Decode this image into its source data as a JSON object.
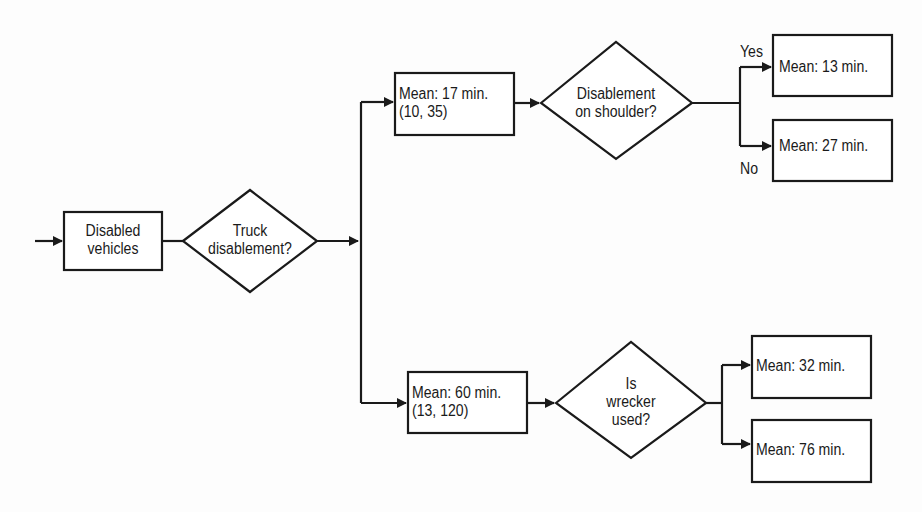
{
  "diagram": {
    "type": "decision-tree",
    "colors": {
      "stroke": "#1a1a1a",
      "background": "#fdfdfd"
    },
    "nodes": {
      "start": {
        "line1": "Disabled",
        "line2": "vehicles"
      },
      "decision_truck": {
        "line1": "Truck",
        "line2": "disablement?"
      },
      "upper_box": {
        "line1": "Mean: 17 min.",
        "line2": "(10, 35)"
      },
      "decision_shoulder": {
        "line1": "Disablement",
        "line2": "on shoulder?"
      },
      "shoulder_yes": {
        "label": "Mean: 13 min."
      },
      "shoulder_no": {
        "label": "Mean: 27 min."
      },
      "lower_box": {
        "line1": "Mean: 60 min.",
        "line2": "(13, 120)"
      },
      "decision_wrecker": {
        "line1": "Is",
        "line2": "wrecker",
        "line3": "used?"
      },
      "wrecker_a": {
        "label": "Mean: 32 min."
      },
      "wrecker_b": {
        "label": "Mean: 76 min."
      }
    },
    "edge_labels": {
      "yes": "Yes",
      "no": "No"
    }
  }
}
